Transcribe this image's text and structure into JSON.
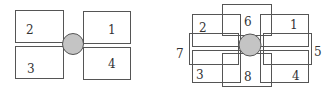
{
  "diagrams": [
    {
      "name": "four-block",
      "hub": {
        "cx": 73,
        "cy": 44,
        "r": 10.5
      },
      "blocks": [
        {
          "label": "2",
          "x": 15,
          "y": 10,
          "w": 48,
          "h": 32,
          "lx": 26,
          "ly": 34
        },
        {
          "label": "1",
          "x": 83,
          "y": 11,
          "w": 47,
          "h": 32,
          "lx": 108,
          "ly": 34
        },
        {
          "label": "3",
          "x": 15,
          "y": 46,
          "w": 48,
          "h": 32,
          "lx": 27,
          "ly": 73
        },
        {
          "label": "4",
          "x": 83,
          "y": 47,
          "w": 47,
          "h": 32,
          "lx": 108,
          "ly": 68
        }
      ]
    },
    {
      "name": "eight-block",
      "hub": {
        "cx": 250,
        "cy": 45,
        "r": 11
      },
      "blocks": [
        {
          "label": "2",
          "x": 192,
          "y": 14,
          "w": 48,
          "h": 32,
          "lx": 199,
          "ly": 32
        },
        {
          "label": "1",
          "x": 260,
          "y": 14,
          "w": 48,
          "h": 32,
          "lx": 290,
          "ly": 29
        },
        {
          "label": "6",
          "x": 222,
          "y": 4,
          "w": 49,
          "h": 31,
          "lx": 244,
          "ly": 26
        },
        {
          "label": "7",
          "x": 189,
          "y": 33,
          "w": 49,
          "h": 31,
          "lx": 176,
          "ly": 58
        },
        {
          "label": "5",
          "x": 263,
          "y": 33,
          "w": 48,
          "h": 31,
          "lx": 314,
          "ly": 56
        },
        {
          "label": "3",
          "x": 192,
          "y": 50,
          "w": 48,
          "h": 32,
          "lx": 196,
          "ly": 79
        },
        {
          "label": "4",
          "x": 260,
          "y": 50,
          "w": 48,
          "h": 32,
          "lx": 292,
          "ly": 80
        },
        {
          "label": "8",
          "x": 222,
          "y": 53,
          "w": 49,
          "h": 33,
          "lx": 244,
          "ly": 81
        }
      ]
    }
  ]
}
